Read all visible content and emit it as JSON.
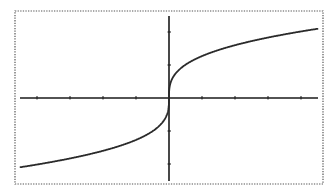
{
  "chart_data": {
    "type": "line",
    "title": "",
    "xlabel": "",
    "ylabel": "",
    "function": "y = 1.27 * cbrt(x)",
    "xlim": [
      -4.5,
      4.5
    ],
    "ylim": [
      -2.5,
      2.5
    ],
    "x_ticks": [
      -4,
      -3,
      -2,
      -1,
      1,
      2,
      3,
      4
    ],
    "y_ticks": [
      -2,
      -1,
      1,
      2
    ],
    "grid": false,
    "legend": null,
    "series": [
      {
        "name": "f(x)",
        "x": [
          -4.5,
          -4,
          -3,
          -2,
          -1,
          -0.5,
          -0.2,
          -0.05,
          0,
          0.05,
          0.2,
          0.5,
          1,
          2,
          3,
          4,
          4.5
        ],
        "values": [
          -2.1,
          -2.02,
          -1.83,
          -1.6,
          -1.27,
          -1.01,
          -0.74,
          -0.47,
          0,
          0.47,
          0.74,
          1.01,
          1.27,
          1.6,
          1.83,
          2.02,
          2.1
        ]
      }
    ]
  },
  "colors": {
    "background": "#ffffff",
    "axis": "#1a1a1a",
    "curve": "#2a2a2a",
    "frame": "#555555"
  }
}
